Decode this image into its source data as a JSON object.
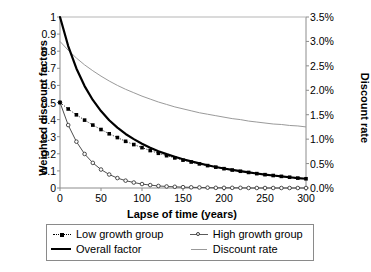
{
  "chart_data": {
    "type": "line",
    "title": "",
    "xlabel": "Lapse of time (years)",
    "ylabel": "Weighted discount factors",
    "y2label": "Discount rate",
    "xlim": [
      0,
      300
    ],
    "ylim": [
      0,
      1
    ],
    "y2lim": [
      0,
      3.5
    ],
    "xticks": [
      "0",
      "50",
      "100",
      "150",
      "200",
      "250",
      "300"
    ],
    "yticks": [
      "1",
      "0.9",
      "0.8",
      "0.7",
      "0.6",
      "0.5",
      "0.4",
      "0.3",
      "0.2",
      "0.1",
      "0"
    ],
    "y2ticks": [
      "3.5%",
      "3.0%",
      "2.5%",
      "2.0%",
      "1.5%",
      "1.0%",
      "0.5%",
      "0.0%"
    ],
    "grid": false,
    "legend_position": "below-axis",
    "x": [
      0,
      10,
      20,
      30,
      40,
      50,
      60,
      70,
      80,
      90,
      100,
      110,
      120,
      130,
      140,
      150,
      160,
      170,
      180,
      190,
      200,
      210,
      220,
      230,
      240,
      250,
      260,
      270,
      280,
      290,
      300
    ],
    "series": [
      {
        "name": "Low growth group",
        "axis": "left",
        "marker": "filled-square",
        "line": "dotted",
        "color": "#000000",
        "values": [
          0.5,
          0.462,
          0.428,
          0.397,
          0.368,
          0.342,
          0.317,
          0.295,
          0.273,
          0.254,
          0.236,
          0.219,
          0.203,
          0.189,
          0.176,
          0.163,
          0.152,
          0.141,
          0.131,
          0.122,
          0.113,
          0.105,
          0.098,
          0.091,
          0.084,
          0.078,
          0.073,
          0.068,
          0.063,
          0.058,
          0.054
        ]
      },
      {
        "name": "High growth group",
        "axis": "left",
        "marker": "open-circle",
        "line": "thin",
        "color": "#3a3a3a",
        "values": [
          0.5,
          0.368,
          0.271,
          0.199,
          0.147,
          0.108,
          0.079,
          0.058,
          0.043,
          0.032,
          0.023,
          0.017,
          0.012,
          0.009,
          0.007,
          0.005,
          0.004,
          0.003,
          0.002,
          0.001,
          0.001,
          0.001,
          0.001,
          0.0,
          0.0,
          0.0,
          0.0,
          0.0,
          0.0,
          0.0,
          0.0
        ]
      },
      {
        "name": "Overall factor",
        "axis": "left",
        "marker": "none",
        "line": "thick",
        "color": "#000000",
        "values": [
          1.0,
          0.83,
          0.699,
          0.596,
          0.515,
          0.45,
          0.396,
          0.353,
          0.316,
          0.286,
          0.259,
          0.236,
          0.215,
          0.198,
          0.183,
          0.168,
          0.156,
          0.144,
          0.133,
          0.123,
          0.114,
          0.106,
          0.099,
          0.091,
          0.085,
          0.078,
          0.073,
          0.068,
          0.063,
          0.058,
          0.054
        ]
      },
      {
        "name": "Discount rate",
        "axis": "right",
        "marker": "none",
        "line": "thin-gray",
        "color": "#9a9a9a",
        "values": [
          3.0,
          2.82,
          2.66,
          2.52,
          2.4,
          2.29,
          2.19,
          2.1,
          2.02,
          1.95,
          1.88,
          1.82,
          1.76,
          1.71,
          1.66,
          1.62,
          1.58,
          1.54,
          1.51,
          1.48,
          1.45,
          1.42,
          1.4,
          1.37,
          1.35,
          1.33,
          1.31,
          1.3,
          1.28,
          1.27,
          1.25
        ]
      }
    ]
  },
  "axes": {
    "x_title": "Lapse of time (years)",
    "y_left_title": "Weighted discount factors",
    "y_right_title": "Discount rate"
  },
  "legend": {
    "entries": [
      {
        "label": "Low growth group",
        "key": "dotted-square-marker"
      },
      {
        "label": "High growth group",
        "key": "thin-circle-marker"
      },
      {
        "label": "Overall factor",
        "key": "thick-solid-line"
      },
      {
        "label": "Discount rate",
        "key": "thin-gray-line"
      }
    ]
  }
}
